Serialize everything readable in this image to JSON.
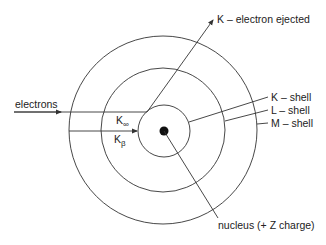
{
  "diagram": {
    "type": "atomic-shell-xray-emission",
    "colors": {
      "line": "#333333",
      "nucleus": "#111111",
      "text": "#222222",
      "background": "#ffffff"
    },
    "labels": {
      "ejected": "K – electron ejected",
      "incoming": "electrons",
      "k_alpha_main": "K",
      "k_alpha_sub": "∞",
      "k_beta_main": "K",
      "k_beta_sub": "β",
      "k_shell": "K – shell",
      "l_shell": "L – shell",
      "m_shell": "M – shell",
      "nucleus": "nucleus (+ Z charge)"
    },
    "shells": [
      {
        "name": "K",
        "radius": 26
      },
      {
        "name": "L",
        "radius": 62
      },
      {
        "name": "M",
        "radius": 94
      }
    ]
  }
}
